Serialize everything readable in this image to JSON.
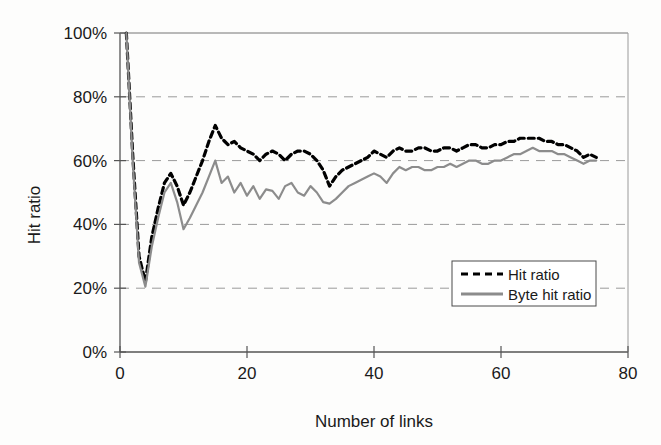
{
  "chart_data": {
    "type": "line",
    "title": "",
    "xlabel": "Number of links",
    "ylabel": "Hit ratio",
    "xlim": [
      0,
      80
    ],
    "ylim": [
      0,
      1.0
    ],
    "xticks": [
      "0",
      "20",
      "40",
      "60",
      "80"
    ],
    "xtick_values": [
      0,
      20,
      40,
      60,
      80
    ],
    "yticks": [
      "0%",
      "20%",
      "40%",
      "60%",
      "80%",
      "100%"
    ],
    "ytick_values": [
      0,
      0.2,
      0.4,
      0.6,
      0.8,
      1.0
    ],
    "grid": "horizontal-dashed",
    "legend_position": "lower-right-inside",
    "x": [
      1,
      2,
      3,
      4,
      5,
      6,
      7,
      8,
      9,
      10,
      11,
      12,
      13,
      14,
      15,
      16,
      17,
      18,
      19,
      20,
      21,
      22,
      23,
      24,
      25,
      26,
      27,
      28,
      29,
      30,
      31,
      32,
      33,
      34,
      35,
      36,
      37,
      38,
      39,
      40,
      41,
      42,
      43,
      44,
      45,
      46,
      47,
      48,
      49,
      50,
      51,
      52,
      53,
      54,
      55,
      56,
      57,
      58,
      59,
      60,
      61,
      62,
      63,
      64,
      65,
      66,
      67,
      68,
      69,
      70,
      71,
      72,
      73,
      74,
      75
    ],
    "series": [
      {
        "name": "Hit ratio",
        "style": "dashed",
        "color": "#000000",
        "values": [
          1.0,
          0.62,
          0.3,
          0.22,
          0.36,
          0.45,
          0.53,
          0.56,
          0.52,
          0.46,
          0.5,
          0.55,
          0.6,
          0.66,
          0.71,
          0.67,
          0.65,
          0.66,
          0.64,
          0.63,
          0.62,
          0.6,
          0.62,
          0.63,
          0.62,
          0.6,
          0.62,
          0.63,
          0.63,
          0.62,
          0.6,
          0.57,
          0.52,
          0.55,
          0.57,
          0.58,
          0.59,
          0.6,
          0.61,
          0.63,
          0.62,
          0.61,
          0.63,
          0.64,
          0.63,
          0.63,
          0.64,
          0.64,
          0.63,
          0.63,
          0.64,
          0.64,
          0.63,
          0.64,
          0.65,
          0.65,
          0.64,
          0.64,
          0.65,
          0.65,
          0.66,
          0.66,
          0.67,
          0.67,
          0.67,
          0.67,
          0.66,
          0.66,
          0.65,
          0.65,
          0.64,
          0.63,
          0.61,
          0.62,
          0.61
        ]
      },
      {
        "name": "Byte hit ratio",
        "style": "solid",
        "color": "#8c8c8c",
        "values": [
          1.0,
          0.6,
          0.28,
          0.205,
          0.33,
          0.42,
          0.5,
          0.53,
          0.47,
          0.385,
          0.42,
          0.46,
          0.5,
          0.55,
          0.6,
          0.53,
          0.55,
          0.5,
          0.53,
          0.49,
          0.52,
          0.48,
          0.51,
          0.505,
          0.48,
          0.52,
          0.53,
          0.5,
          0.49,
          0.52,
          0.5,
          0.47,
          0.465,
          0.48,
          0.5,
          0.52,
          0.53,
          0.54,
          0.55,
          0.56,
          0.55,
          0.53,
          0.56,
          0.58,
          0.57,
          0.58,
          0.58,
          0.57,
          0.57,
          0.58,
          0.58,
          0.59,
          0.58,
          0.59,
          0.6,
          0.6,
          0.59,
          0.59,
          0.6,
          0.6,
          0.61,
          0.62,
          0.62,
          0.63,
          0.64,
          0.63,
          0.63,
          0.63,
          0.62,
          0.62,
          0.61,
          0.6,
          0.59,
          0.6,
          0.6
        ]
      }
    ],
    "legend": [
      {
        "label": "Hit ratio",
        "style": "dashed",
        "color": "#000000"
      },
      {
        "label": "Byte hit ratio",
        "style": "solid",
        "color": "#8c8c8c"
      }
    ]
  }
}
